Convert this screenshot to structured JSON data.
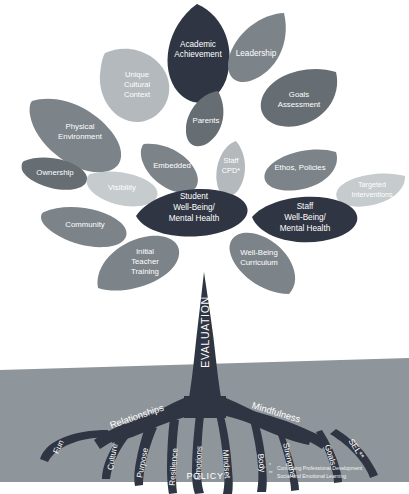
{
  "diagram": {
    "type": "tree-metaphor-diagram"
  },
  "palette": {
    "background": "#ffffff",
    "leaf_dark": "#2f3542",
    "leaf_mid_dark": "#666d73",
    "leaf_mid": "#7c8389",
    "leaf_light": "#9aa1a6",
    "leaf_lighter": "#b3b9bd",
    "leaf_lightest": "#c6cbcd",
    "trunk": "#2f3542",
    "soil": "#8f969b",
    "text": "#ffffff"
  },
  "leaves": [
    {
      "id": "academic-achievement",
      "label": "Academic\nAchievement",
      "lines": [
        "Academic",
        "Achievement"
      ],
      "tone": "leaf_dark"
    },
    {
      "id": "leadership",
      "label": "Leadership",
      "lines": [
        "Leadership"
      ],
      "tone": "leaf_mid"
    },
    {
      "id": "unique-cultural-context",
      "label": "Unique Cultural Context",
      "lines": [
        "Unique",
        "Cultural",
        "Context"
      ],
      "tone": "leaf_lighter"
    },
    {
      "id": "goals-assessment",
      "label": "Goals Assessment",
      "lines": [
        "Goals",
        "Assessment"
      ],
      "tone": "leaf_mid_dark"
    },
    {
      "id": "physical-environment",
      "label": "Physical Environment",
      "lines": [
        "Physical",
        "Environment"
      ],
      "tone": "leaf_mid"
    },
    {
      "id": "parents",
      "label": "Parents",
      "lines": [
        "Parents"
      ],
      "tone": "leaf_mid_dark"
    },
    {
      "id": "ownership",
      "label": "Ownership",
      "lines": [
        "Ownership"
      ],
      "tone": "leaf_mid_dark"
    },
    {
      "id": "embedded",
      "label": "Embedded",
      "lines": [
        "Embedded"
      ],
      "tone": "leaf_mid"
    },
    {
      "id": "staff-cpd",
      "label": "Staff CPD*",
      "lines": [
        "Staff",
        "CPD*"
      ],
      "tone": "leaf_lighter"
    },
    {
      "id": "ethos-policies",
      "label": "Ethos, Policies",
      "lines": [
        "Ethos, Policies"
      ],
      "tone": "leaf_mid"
    },
    {
      "id": "visibility",
      "label": "Visibility",
      "lines": [
        "Visibility"
      ],
      "tone": "leaf_lightest"
    },
    {
      "id": "targeted-interventions",
      "label": "Targeted Interventions",
      "lines": [
        "Targeted",
        "Interventions"
      ],
      "tone": "leaf_lightest"
    },
    {
      "id": "student-well-being",
      "label": "Student Well-Being/ Mental Health",
      "lines": [
        "Student",
        "Well-Being/",
        "Mental Health"
      ],
      "tone": "leaf_dark"
    },
    {
      "id": "staff-well-being",
      "label": "Staff Well-Being/ Mental Health",
      "lines": [
        "Staff",
        "Well-Being/",
        "Mental Health"
      ],
      "tone": "leaf_dark"
    },
    {
      "id": "community",
      "label": "Community",
      "lines": [
        "Community"
      ],
      "tone": "leaf_mid"
    },
    {
      "id": "initial-teacher-training",
      "label": "Initial Teacher Training",
      "lines": [
        "Initial",
        "Teacher",
        "Training"
      ],
      "tone": "leaf_mid"
    },
    {
      "id": "well-being-curriculum",
      "label": "Well-Being Curriculum",
      "lines": [
        "Well-Being",
        "Curriculum"
      ],
      "tone": "leaf_mid"
    }
  ],
  "trunk": {
    "label": "EVALUATION"
  },
  "roots": [
    {
      "id": "fun",
      "label": "Fun"
    },
    {
      "id": "culture",
      "label": "Culture"
    },
    {
      "id": "relationships",
      "label": "Relationships"
    },
    {
      "id": "purpose",
      "label": "Purpose"
    },
    {
      "id": "resilience",
      "label": "Resilience"
    },
    {
      "id": "emotions",
      "label": "Emotions"
    },
    {
      "id": "mindset",
      "label": "Mindset"
    },
    {
      "id": "body",
      "label": "Body"
    },
    {
      "id": "strengths",
      "label": "Strengths"
    },
    {
      "id": "mindfulness",
      "label": "Mindfulness"
    },
    {
      "id": "goals",
      "label": "Goals"
    },
    {
      "id": "sel",
      "label": "SEL**"
    }
  ],
  "ground": {
    "label": "POLICY"
  },
  "footnotes": [
    {
      "marker": "*",
      "text": "Continuing Professional Development"
    },
    {
      "marker": "**",
      "text": "Social and Emotional Learning"
    }
  ]
}
